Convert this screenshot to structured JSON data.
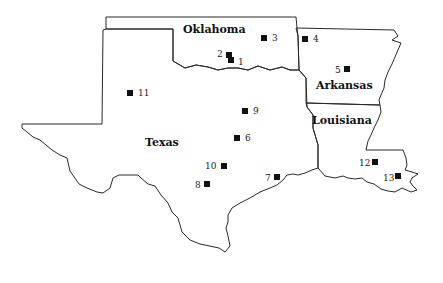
{
  "map": {
    "states": [
      {
        "id": "oklahoma",
        "label": "Oklahoma",
        "x": 183,
        "y": 33
      },
      {
        "id": "arkansas",
        "label": "Arkansas",
        "x": 316,
        "y": 89
      },
      {
        "id": "louisiana",
        "label": "Louisiana",
        "x": 312,
        "y": 124
      },
      {
        "id": "texas",
        "label": "Texas",
        "x": 145,
        "y": 146
      }
    ],
    "sites": [
      {
        "n": "1",
        "x": 231,
        "y": 60,
        "lx": 238,
        "ly": 65
      },
      {
        "n": "2",
        "x": 229,
        "y": 55,
        "lx": 217,
        "ly": 57
      },
      {
        "n": "3",
        "x": 264,
        "y": 38,
        "lx": 272,
        "ly": 41
      },
      {
        "n": "4",
        "x": 305,
        "y": 39,
        "lx": 313,
        "ly": 42
      },
      {
        "n": "5",
        "x": 347,
        "y": 69,
        "lx": 335,
        "ly": 73
      },
      {
        "n": "6",
        "x": 237,
        "y": 138,
        "lx": 245,
        "ly": 141
      },
      {
        "n": "7",
        "x": 277,
        "y": 177,
        "lx": 265,
        "ly": 181
      },
      {
        "n": "8",
        "x": 207,
        "y": 184,
        "lx": 195,
        "ly": 188
      },
      {
        "n": "9",
        "x": 245,
        "y": 111,
        "lx": 253,
        "ly": 114
      },
      {
        "n": "10",
        "x": 224,
        "y": 166,
        "lx": 205,
        "ly": 169
      },
      {
        "n": "11",
        "x": 130,
        "y": 93,
        "lx": 138,
        "ly": 96
      },
      {
        "n": "12",
        "x": 375,
        "y": 162,
        "lx": 359,
        "ly": 166
      },
      {
        "n": "13",
        "x": 398,
        "y": 176,
        "lx": 383,
        "ly": 181
      }
    ]
  }
}
